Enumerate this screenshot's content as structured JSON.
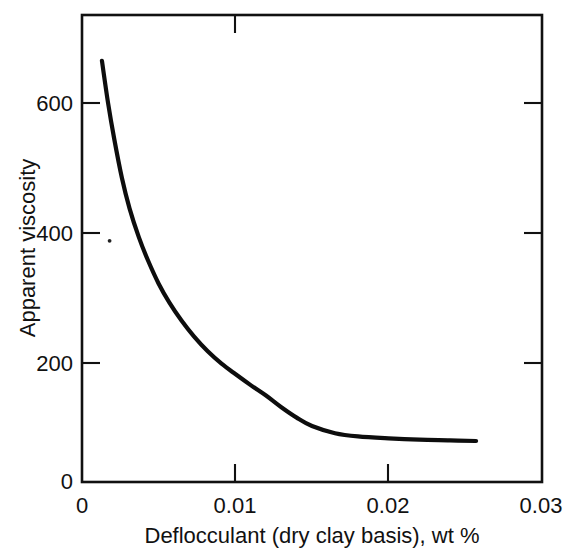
{
  "figure": {
    "background_color": "#ffffff",
    "ink_color": "#111111",
    "curve_color": "#0d0d0d"
  },
  "chart_data": {
    "type": "line",
    "title": "",
    "subtitle": "",
    "xlabel": "Deflocculant (dry clay basis), wt %",
    "ylabel": "Apparent viscosity",
    "xlim": [
      0,
      0.03
    ],
    "ylim": [
      0,
      700
    ],
    "x_ticks": [
      0,
      0.01,
      0.02,
      0.03
    ],
    "x_tick_labels": [
      "0",
      "0.01",
      "0.02",
      "0.03"
    ],
    "y_ticks": [
      0,
      200,
      400,
      600
    ],
    "y_tick_labels": [
      "0",
      "200",
      "400",
      "600"
    ],
    "grid": false,
    "legend": false,
    "legend_position": "none",
    "tick_direction": "in",
    "frame": "full-box",
    "series": [
      {
        "name": "Apparent viscosity",
        "x": [
          0.0013,
          0.0017,
          0.0021,
          0.0026,
          0.0031,
          0.0037,
          0.0043,
          0.005,
          0.0057,
          0.0065,
          0.0073,
          0.0082,
          0.0091,
          0.01,
          0.011,
          0.012,
          0.013,
          0.014,
          0.015,
          0.0165,
          0.018,
          0.02,
          0.022,
          0.024,
          0.0257
        ],
        "values": [
          665,
          600,
          545,
          485,
          438,
          394,
          358,
          322,
          293,
          265,
          241,
          218,
          199,
          183,
          166,
          150,
          132,
          116,
          103,
          92,
          87,
          84,
          82,
          81,
          80
        ]
      }
    ],
    "annotations": [
      {
        "name": "print-speck",
        "x": 0.0018,
        "y": 388
      }
    ]
  }
}
